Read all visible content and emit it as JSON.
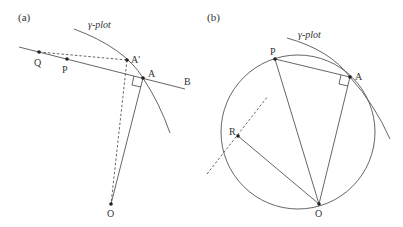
{
  "panels": [
    {
      "id": "a",
      "label": "(a)",
      "curve_label": "γ-plot",
      "points": {
        "Q": {
          "label": "Q",
          "x": 39,
          "y": 52
        },
        "P": {
          "label": "P",
          "x": 67,
          "y": 59
        },
        "A_prime": {
          "label": "A'",
          "x": 127,
          "y": 60
        },
        "A": {
          "label": "A",
          "x": 143,
          "y": 78
        },
        "B": {
          "label": "B"
        },
        "O": {
          "label": "O",
          "x": 111,
          "y": 204
        }
      },
      "elements": [
        "tangent line through Q, P, A to B",
        "dashed Q–A'",
        "dashed A'–O",
        "solid A–O",
        "right-angle mark at A"
      ]
    },
    {
      "id": "b",
      "label": "(b)",
      "curve_label": "γ-plot",
      "points": {
        "P": {
          "label": "P",
          "x": 275,
          "y": 59
        },
        "A": {
          "label": "A",
          "x": 350,
          "y": 77
        },
        "R": {
          "label": "R",
          "x": 238,
          "y": 136
        },
        "O": {
          "label": "O",
          "x": 319,
          "y": 204
        }
      },
      "circle": {
        "cx": 298,
        "cy": 132,
        "r": 77
      },
      "elements": [
        "circle through O, A, P",
        "solid P–A",
        "solid P–O",
        "solid A–O",
        "solid R–O",
        "dashed line through R perpendicular to RO",
        "right-angle mark at A"
      ]
    }
  ],
  "colors": {
    "line": "#555555",
    "dot": "#222222",
    "text": "#333333",
    "background": "#ffffff"
  }
}
